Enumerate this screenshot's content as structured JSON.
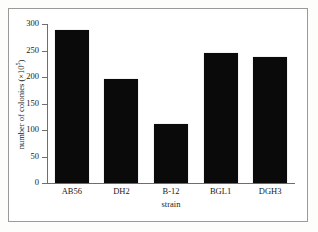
{
  "chart_data": {
    "type": "bar",
    "title": "",
    "categories": [
      "AB56",
      "DH2",
      "B-12",
      "BGL1",
      "DGH3"
    ],
    "values": [
      288,
      196,
      112,
      246,
      237
    ],
    "xlabel": "strain",
    "ylabel": "number of colonies (×10⁵)",
    "ylabel_text": "number of colonies (×10",
    "ylabel_exponent": "5",
    "ylabel_suffix": ")",
    "ylim": [
      0,
      300
    ],
    "yticks": [
      0,
      50,
      100,
      150,
      200,
      250,
      300
    ],
    "ytick_labels": [
      "0",
      "50",
      "100",
      "150",
      "200",
      "250",
      "300"
    ],
    "grid": false,
    "legend": false,
    "bar_color": "#0a0a0a",
    "axis_color": "#6e6e6e",
    "background_color": "#ffffff",
    "frame_color": "#9a9a9a"
  },
  "figure": {
    "frame_visible": true
  }
}
